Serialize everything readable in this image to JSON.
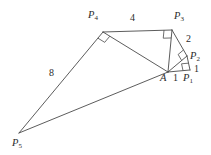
{
  "figure": {
    "stroke_color": "#4a4a4a",
    "text_color": "#2b2b2b",
    "background_color": "#ffffff",
    "width": 211,
    "height": 155
  },
  "points": [
    {
      "key": "A",
      "label": "A",
      "sub": "",
      "x": 168,
      "y": 72,
      "label_x": 160,
      "label_y": 73
    },
    {
      "key": "P1",
      "label": "P",
      "sub": "1",
      "x": 190,
      "y": 70,
      "label_x": 183,
      "label_y": 73
    },
    {
      "key": "P2",
      "label": "P",
      "sub": "2",
      "x": 187,
      "y": 56,
      "label_x": 190,
      "label_y": 51
    },
    {
      "key": "P3",
      "label": "P",
      "sub": "3",
      "x": 172,
      "y": 30,
      "label_x": 174,
      "label_y": 11
    },
    {
      "key": "P4",
      "label": "P",
      "sub": "4",
      "x": 103,
      "y": 32,
      "label_x": 88,
      "label_y": 10
    },
    {
      "key": "P5",
      "label": "P",
      "sub": "5",
      "x": 19,
      "y": 133,
      "label_x": 12,
      "label_y": 138
    }
  ],
  "edges": [
    {
      "name": "edge-A-P1",
      "from": "A",
      "to": "P1"
    },
    {
      "name": "edge-P1-P2",
      "from": "P1",
      "to": "P2"
    },
    {
      "name": "edge-A-P2",
      "from": "A",
      "to": "P2"
    },
    {
      "name": "edge-P2-P3",
      "from": "P2",
      "to": "P3"
    },
    {
      "name": "edge-A-P3",
      "from": "A",
      "to": "P3"
    },
    {
      "name": "edge-P3-P4",
      "from": "P3",
      "to": "P4"
    },
    {
      "name": "edge-A-P4",
      "from": "A",
      "to": "P4"
    },
    {
      "name": "edge-P4-P5",
      "from": "P4",
      "to": "P5"
    },
    {
      "name": "edge-A-P5",
      "from": "A",
      "to": "P5"
    }
  ],
  "length_labels": [
    {
      "name": "length-A-P1",
      "text": "1",
      "x": 173,
      "y": 73
    },
    {
      "name": "length-P1-P2",
      "text": "1",
      "x": 194,
      "y": 64
    },
    {
      "name": "length-P2-P3",
      "text": "2",
      "x": 186,
      "y": 34
    },
    {
      "name": "length-P3-P4",
      "text": "4",
      "x": 130,
      "y": 13
    },
    {
      "name": "length-P4-P5",
      "text": "8",
      "x": 49,
      "y": 68
    }
  ],
  "right_angle_marks": [
    {
      "name": "right-angle-at-P1",
      "vertex": "P1",
      "arm_a": "A",
      "arm_b": "P2",
      "size": 7
    },
    {
      "name": "right-angle-at-P2",
      "vertex": "P2",
      "arm_a": "A",
      "arm_b": "P3",
      "size": 7
    },
    {
      "name": "right-angle-at-P3",
      "vertex": "P3",
      "arm_a": "A",
      "arm_b": "P4",
      "size": 8
    },
    {
      "name": "right-angle-at-P4",
      "vertex": "P4",
      "arm_a": "A",
      "arm_b": "P5",
      "size": 8
    }
  ]
}
